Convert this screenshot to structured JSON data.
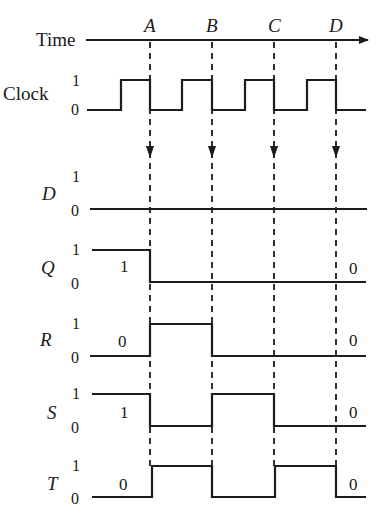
{
  "diagram": {
    "type": "timing-diagram",
    "time_axis": {
      "label": "Time",
      "markers": [
        {
          "label": "A",
          "x": 150
        },
        {
          "label": "B",
          "x": 212
        },
        {
          "label": "C",
          "x": 274
        },
        {
          "label": "D",
          "x": 336
        }
      ]
    },
    "level_labels": {
      "high": "1",
      "low": "0"
    },
    "signals": [
      {
        "name": "Clock",
        "italic": false,
        "high_y": 80,
        "low_y": 110,
        "path": "M87,110 H121 V80 H150 V110 H182 V80 H212 V110 H245 V80 H274 V110 H307 V80 H336 V110 H366",
        "start_value": "",
        "end_value": ""
      },
      {
        "name": "D",
        "italic": true,
        "high_y": 177,
        "low_y": 209,
        "path": "M90,209 H367",
        "start_value": "",
        "end_value": ""
      },
      {
        "name": "Q",
        "italic": true,
        "high_y": 250,
        "low_y": 282,
        "path": "M92,250 H150 V282 H366",
        "start_value": "1",
        "end_value": "0"
      },
      {
        "name": "R",
        "italic": true,
        "high_y": 324,
        "low_y": 356,
        "path": "M90,356 H150 V324 H212 V356 H366",
        "start_value": "0",
        "end_value": "0"
      },
      {
        "name": "S",
        "italic": true,
        "high_y": 394,
        "low_y": 426,
        "path": "M92,394 H150 V426 H212 V394 H274 V426 H366",
        "start_value": "1",
        "end_value": "0"
      },
      {
        "name": "T",
        "italic": true,
        "high_y": 466,
        "low_y": 497,
        "path": "M92,497 H152 V466 H212 V497 H275 V466 H336 V497 H366",
        "start_value": "0",
        "end_value": "0"
      }
    ]
  }
}
